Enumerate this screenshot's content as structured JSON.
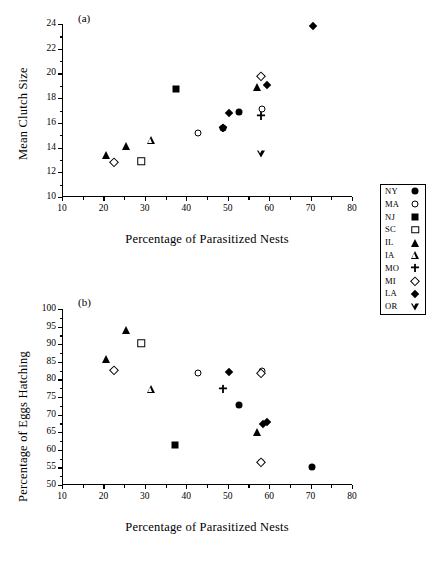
{
  "figure": {
    "panel_a_tag": "(a)",
    "panel_b_tag": "(b)"
  },
  "panel_a": {
    "tag": "(a)",
    "ylabel": "Mean Clutch Size",
    "xlabel": "Percentage of Parasitized Nests",
    "yticks": [
      "10",
      "12",
      "14",
      "16",
      "18",
      "20",
      "22",
      "24"
    ],
    "xticks": [
      "10",
      "20",
      "30",
      "40",
      "50",
      "60",
      "70",
      "80"
    ]
  },
  "panel_b": {
    "tag": "(b)",
    "ylabel": "Percentage of Eggs Hatching",
    "xlabel": "Percentage of Parasitized Nests",
    "yticks": [
      "50",
      "55",
      "60",
      "65",
      "70",
      "75",
      "80",
      "85",
      "90",
      "95",
      "100"
    ],
    "xticks": [
      "10",
      "20",
      "30",
      "40",
      "50",
      "60",
      "70",
      "80"
    ]
  },
  "legend": {
    "entries": [
      {
        "label": "NY",
        "marker": "circle-filled"
      },
      {
        "label": "MA",
        "marker": "circle-open"
      },
      {
        "label": "NJ",
        "marker": "square-filled"
      },
      {
        "label": "SC",
        "marker": "square-open"
      },
      {
        "label": "IL",
        "marker": "tri-filled"
      },
      {
        "label": "IA",
        "marker": "tri-open"
      },
      {
        "label": "MO",
        "marker": "plus-filled"
      },
      {
        "label": "MI",
        "marker": "diamond-open"
      },
      {
        "label": "LA",
        "marker": "diamond-filled"
      },
      {
        "label": "OR",
        "marker": "tridown-open"
      }
    ]
  },
  "chart_data": [
    {
      "type": "scatter",
      "panel": "(a)",
      "title": "",
      "xlabel": "Percentage of Parasitized Nests",
      "ylabel": "Mean Clutch Size",
      "xlim": [
        10,
        80
      ],
      "ylim": [
        10,
        24
      ],
      "xticks": [
        10,
        20,
        30,
        40,
        50,
        60,
        70,
        80
      ],
      "yticks": [
        10,
        12,
        14,
        16,
        18,
        20,
        22,
        24
      ],
      "grid": false,
      "legend_position": "right-outside",
      "series": [
        {
          "name": "NY",
          "marker": "circle-filled",
          "points": [
            [
              52.6,
              16.9
            ],
            [
              48.7,
              15.6
            ]
          ]
        },
        {
          "name": "MA",
          "marker": "circle-open",
          "points": [
            [
              42.5,
              15.2
            ],
            [
              58.0,
              17.1
            ]
          ]
        },
        {
          "name": "NJ",
          "marker": "square-filled",
          "points": [
            [
              37.2,
              18.75
            ]
          ]
        },
        {
          "name": "SC",
          "marker": "square-open",
          "points": [
            [
              28.9,
              12.9
            ]
          ]
        },
        {
          "name": "IL",
          "marker": "tri-filled",
          "points": [
            [
              20.3,
              13.4
            ],
            [
              25.1,
              14.15
            ],
            [
              56.8,
              18.9
            ]
          ]
        },
        {
          "name": "IA",
          "marker": "tri-open",
          "points": [
            [
              31.2,
              14.65
            ]
          ]
        },
        {
          "name": "MO",
          "marker": "plus-filled",
          "points": [
            [
              48.6,
              15.55
            ],
            [
              57.9,
              16.55
            ]
          ]
        },
        {
          "name": "MI",
          "marker": "diamond-open",
          "points": [
            [
              22.4,
              12.8
            ],
            [
              57.9,
              19.8
            ]
          ]
        },
        {
          "name": "LA",
          "marker": "diamond-filled",
          "points": [
            [
              50.1,
              16.8
            ],
            [
              59.2,
              19.1
            ],
            [
              70.3,
              23.85
            ]
          ]
        },
        {
          "name": "OR",
          "marker": "tridown-open",
          "points": [
            [
              57.8,
              13.5
            ]
          ]
        }
      ]
    },
    {
      "type": "scatter",
      "panel": "(b)",
      "title": "",
      "xlabel": "Percentage of Parasitized Nests",
      "ylabel": "Percentage of Eggs Hatching",
      "xlim": [
        10,
        80
      ],
      "ylim": [
        50,
        100
      ],
      "xticks": [
        10,
        20,
        30,
        40,
        50,
        60,
        70,
        80
      ],
      "yticks": [
        50,
        55,
        60,
        65,
        70,
        75,
        80,
        85,
        90,
        95,
        100
      ],
      "grid": false,
      "legend_position": "right-outside",
      "series": [
        {
          "name": "NY",
          "marker": "circle-filled",
          "points": [
            [
              52.6,
              72.6
            ],
            [
              70.2,
              55.1
            ]
          ]
        },
        {
          "name": "MA",
          "marker": "circle-open",
          "points": [
            [
              42.5,
              81.7
            ],
            [
              58.1,
              82.4
            ],
            [
              57.8,
              56.4
            ]
          ]
        },
        {
          "name": "NJ",
          "marker": "square-filled",
          "points": [
            [
              37.1,
              61.5
            ]
          ]
        },
        {
          "name": "SC",
          "marker": "square-open",
          "points": [
            [
              28.9,
              90.3
            ]
          ]
        },
        {
          "name": "IL",
          "marker": "tri-filled",
          "points": [
            [
              20.4,
              85.9
            ],
            [
              25.2,
              94.0
            ],
            [
              56.8,
              65.0
            ]
          ]
        },
        {
          "name": "IA",
          "marker": "tri-open",
          "points": [
            [
              31.2,
              77.3
            ]
          ]
        },
        {
          "name": "MO",
          "marker": "plus-filled",
          "points": [
            [
              48.7,
              77.4
            ]
          ]
        },
        {
          "name": "MI",
          "marker": "diamond-open",
          "points": [
            [
              22.4,
              82.7
            ],
            [
              57.9,
              81.9
            ],
            [
              57.8,
              56.6
            ]
          ]
        },
        {
          "name": "LA",
          "marker": "diamond-filled",
          "points": [
            [
              50.1,
              82.2
            ],
            [
              58.3,
              67.4
            ],
            [
              59.2,
              68.0
            ]
          ]
        },
        {
          "name": "OR",
          "marker": "tridown-open",
          "points": []
        }
      ]
    }
  ]
}
